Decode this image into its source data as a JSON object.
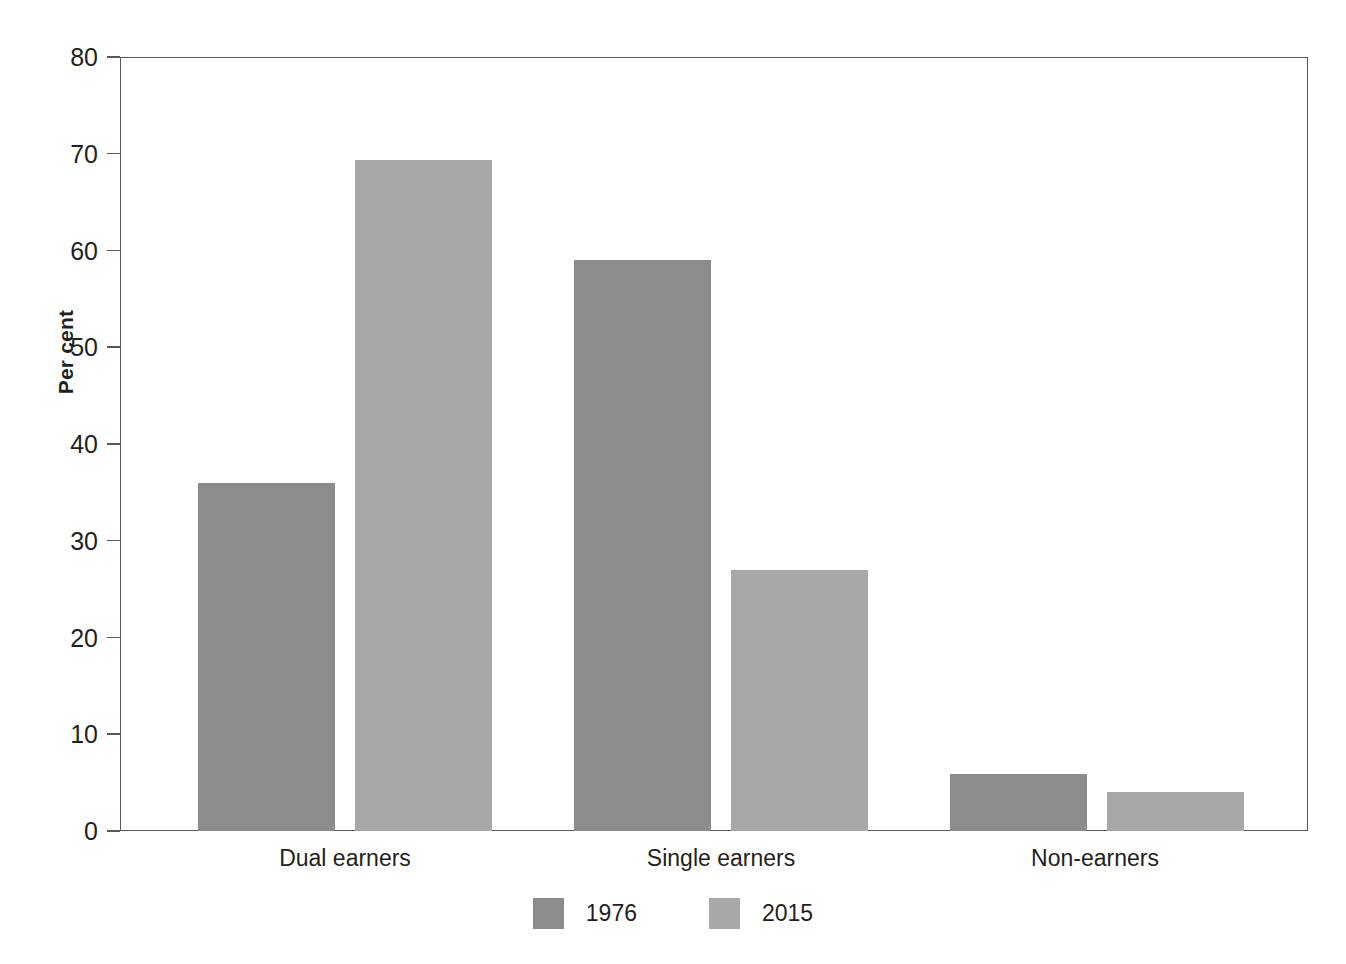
{
  "chart_data": {
    "type": "bar",
    "title": "",
    "xlabel": "",
    "ylabel": "Per cent",
    "ylim": [
      0,
      80
    ],
    "yticks": [
      0,
      10,
      20,
      30,
      40,
      50,
      60,
      70,
      80
    ],
    "ytick_labels": [
      "0",
      "10",
      "20",
      "30",
      "40",
      "50",
      "60",
      "70",
      "80"
    ],
    "grid": false,
    "legend_position": "bottom-center",
    "categories": [
      "Dual earners",
      "Single earners",
      "Non-earners"
    ],
    "series": [
      {
        "name": "1976",
        "color": "#8c8c8c",
        "values": [
          36.0,
          59.0,
          5.9
        ]
      },
      {
        "name": "2015",
        "color": "#a8a8a8",
        "values": [
          69.4,
          27.0,
          4.0
        ]
      }
    ]
  },
  "axis": {
    "frame_color": "#58595b"
  }
}
